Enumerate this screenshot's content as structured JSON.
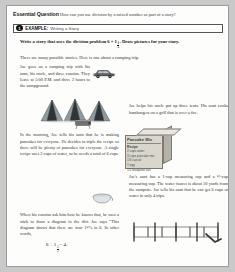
{
  "page": {
    "essential_question": {
      "label": "Essential Question",
      "text": "How can you use division by a mixed number as part of a story?"
    },
    "example": {
      "number": "1",
      "label": "EXAMPLE:",
      "subtitle": "Writing a Story"
    },
    "directive": {
      "before": "Write a story that uses the division problem 6 ÷ 1",
      "frac_num": "1",
      "frac_den": "2",
      "after": ". Draw pictures for your story."
    },
    "lede": "There are many possible stories. Here is one about a camping trip.",
    "story": {
      "p1": "Joe goes on a camping trip with his aunt, his uncle, and three cousins. They leave at 5:00 P.M. and drive 2 hours to the campground.",
      "p2": "Joe helps his uncle put up three tents. His aunt cooks hamburgers on a grill that is over a fire.",
      "p3": "In the morning, Joe tells his aunt that he is making pancakes for everyone. He decides to triple the recipe so there will be plenty of pancakes for everyone. A single recipe uses 2 cups of water, so he needs a total of 6 cups.",
      "p4": "Joe's aunt has a 1-cup measuring cup and a ½-cup measuring cup. The water faucet is about 50 yards from the campsite. Joe tells his aunt that he can get 6 cups of water in only 4 trips.",
      "p5": "When his cousins ask him how he knows that, he uses a stick to draw a diagram in the dirt. Joe says “This diagram shows that there are four 1½'s in 6. In other words,"
    },
    "equation": {
      "lhs": "6 ÷ 1",
      "frac_num": "1",
      "frac_den": "2",
      "rhs": "= 4."
    },
    "pancake_box": {
      "title": "Pancake Mix",
      "recipe_heading": "Recipe",
      "items": [
        "2 cups water",
        "3 cups pancake mix",
        "1/3 cup oil",
        "1 egg",
        "1/2 teaspoon salt"
      ]
    },
    "art_names": {
      "car": "car-illustration",
      "tents": "tents-illustration",
      "grill": "grill-illustration",
      "box": "pancake-mix-box-illustration",
      "diagram": "number-line-diagram-illustration"
    }
  }
}
